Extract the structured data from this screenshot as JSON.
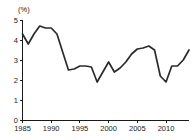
{
  "chart_data": {
    "type": "line",
    "title": "",
    "subtitle": "",
    "xlabel": "",
    "ylabel": "",
    "unit_label": "(%)",
    "xlim": [
      1985,
      2014
    ],
    "ylim": [
      0,
      5
    ],
    "grid": false,
    "legend": false,
    "legend_position": "none",
    "y_ticks": [
      "0",
      "1",
      "2",
      "3",
      "4",
      "5"
    ],
    "y_tick_values": [
      0,
      1,
      2,
      3,
      4,
      5
    ],
    "x_ticks": [
      "1985",
      "1990",
      "1995",
      "2000",
      "2005",
      "2010"
    ],
    "x_tick_values": [
      1985,
      1990,
      1995,
      2000,
      2005,
      2010
    ],
    "series": [
      {
        "name": "value",
        "color": "#2b2b2b",
        "x": [
          1985,
          1986,
          1987,
          1988,
          1989,
          1990,
          1991,
          1992,
          1993,
          1994,
          1995,
          1996,
          1997,
          1998,
          1999,
          2000,
          2001,
          2002,
          2003,
          2004,
          2005,
          2006,
          2007,
          2008,
          2009,
          2010,
          2011,
          2012,
          2013,
          2014
        ],
        "values": [
          4.3,
          3.8,
          4.3,
          4.7,
          4.6,
          4.6,
          4.3,
          3.4,
          2.5,
          2.55,
          2.7,
          2.7,
          2.65,
          1.9,
          2.4,
          2.9,
          2.4,
          2.6,
          2.9,
          3.3,
          3.55,
          3.6,
          3.7,
          3.5,
          2.2,
          1.9,
          2.7,
          2.7,
          3.0,
          3.5
        ]
      }
    ]
  },
  "colors": {
    "line": "#2b2b2b",
    "axis": "#1a1a1a",
    "background": "#ffffff"
  }
}
